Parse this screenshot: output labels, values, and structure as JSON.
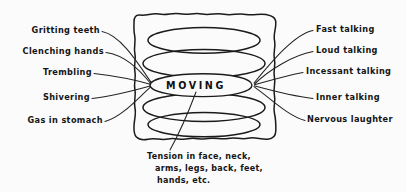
{
  "diagram": {
    "title": "MOVING",
    "center_label": "MOVING",
    "background_color": "#fbfbfb",
    "ink_color": "#1b1b1b",
    "style": "hand-drawn line diagram",
    "box": {
      "name": "moving-center-box",
      "x": 131,
      "y": 14,
      "width": 146,
      "height": 126
    },
    "rings": [
      {
        "name": "ring-top-outer",
        "cy": 40,
        "rx": 58,
        "ry": 13
      },
      {
        "name": "ring-upper",
        "cy": 63,
        "rx": 62,
        "ry": 14
      },
      {
        "name": "ring-center-lens",
        "cy": 85,
        "rx": 52,
        "ry": 11
      },
      {
        "name": "ring-lower",
        "cy": 107,
        "rx": 62,
        "ry": 14
      },
      {
        "name": "ring-bottom-outer",
        "cy": 124,
        "rx": 58,
        "ry": 12
      }
    ],
    "left_labels": [
      {
        "id": "gritting-teeth",
        "text": "Gritting teeth",
        "x_end": 100,
        "y": 32
      },
      {
        "id": "clenching-hands",
        "text": "Clenching hands",
        "x_end": 104,
        "y": 53
      },
      {
        "id": "trembling",
        "text": "Trembling",
        "x_end": 92,
        "y": 74
      },
      {
        "id": "shivering",
        "text": "Shivering",
        "x_end": 90,
        "y": 99
      },
      {
        "id": "gas-in-stomach",
        "text": "Gas in stomach",
        "x_end": 103,
        "y": 122
      }
    ],
    "right_labels": [
      {
        "id": "fast-talking",
        "text": "Fast talking",
        "x_start": 315,
        "y": 31
      },
      {
        "id": "loud-talking",
        "text": "Loud talking",
        "x_start": 315,
        "y": 52
      },
      {
        "id": "incessant-talking",
        "text": "Incessant talking",
        "x_start": 305,
        "y": 73
      },
      {
        "id": "inner-talking",
        "text": "Inner talking",
        "x_start": 315,
        "y": 99
      },
      {
        "id": "nervous-laughter",
        "text": "Nervous laughter",
        "x_start": 307,
        "y": 121
      }
    ],
    "bottom_caption": {
      "id": "tension-caption",
      "line1": "Tension in face, neck,",
      "line2": "arms, legs, back, feet,",
      "line3": "hands, etc.",
      "x": 148,
      "y": 155
    }
  }
}
